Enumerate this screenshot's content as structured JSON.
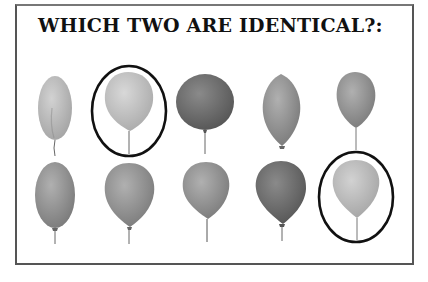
{
  "puzzle": {
    "title": "WHICH TWO ARE IDENTICAL?:",
    "rows": [
      {
        "balloons": [
          {
            "id": "r1b1",
            "shape": "oval-tall",
            "shade": "#a9a9a9",
            "circled": false
          },
          {
            "id": "r1b2",
            "shape": "round",
            "shade": "#b4b4b4",
            "circled": true
          },
          {
            "id": "r1b3",
            "shape": "round-wide",
            "shade": "#6e6e6e",
            "circled": false
          },
          {
            "id": "r1b4",
            "shape": "lemon",
            "shade": "#8c8c8c",
            "circled": false
          },
          {
            "id": "r1b5",
            "shape": "round",
            "shade": "#929292",
            "circled": false
          }
        ]
      },
      {
        "balloons": [
          {
            "id": "r2b1",
            "shape": "oval",
            "shade": "#7e7e7e",
            "circled": false
          },
          {
            "id": "r2b2",
            "shape": "round",
            "shade": "#8a8a8a",
            "circled": false
          },
          {
            "id": "r2b3",
            "shape": "round",
            "shade": "#9c9c9c",
            "circled": false
          },
          {
            "id": "r2b4",
            "shape": "round",
            "shade": "#6c6c6c",
            "circled": false
          },
          {
            "id": "r2b5",
            "shape": "round",
            "shade": "#b6b6b6",
            "circled": true
          }
        ]
      }
    ],
    "circle_color": "#111111"
  }
}
